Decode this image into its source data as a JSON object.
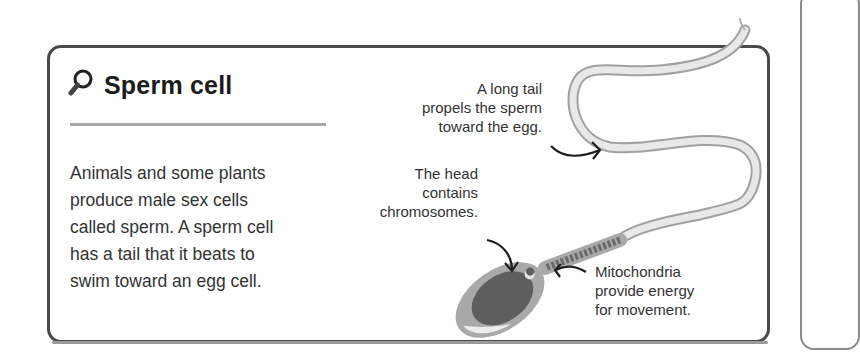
{
  "card": {
    "title": "Sperm cell",
    "title_icon": "magnifier-icon",
    "body_lines": [
      "Animals and some plants",
      "produce male sex cells",
      "called sperm. A sperm cell",
      "has a tail that it beats to",
      "swim toward an egg cell."
    ]
  },
  "annotations": {
    "tail": [
      "A long tail",
      "propels the sperm",
      "toward the egg."
    ],
    "head": [
      "The head",
      "contains",
      "chromosomes."
    ],
    "mitochondria": [
      "Mitochondria",
      "provide energy",
      "for movement."
    ]
  },
  "colors": {
    "border": "#4a4a4a",
    "divider": "#a8a8a8",
    "tail_fill": "#e6e6e6",
    "tail_stroke": "#a0a0a0",
    "head_outer": "#a9a9a9",
    "nucleus": "#5e5e5e",
    "midpiece_bands": "#6a6a6a"
  }
}
